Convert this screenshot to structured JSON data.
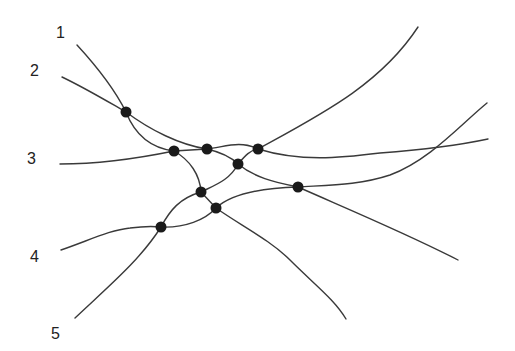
{
  "diagram": {
    "type": "network",
    "colors": {
      "line": "#3a3a3a",
      "node": "#1a1a1a",
      "label": "#222222",
      "background": "#ffffff"
    },
    "labels": [
      {
        "id": "1",
        "text": "1",
        "x": 56,
        "y": 38
      },
      {
        "id": "2",
        "text": "2",
        "x": 30,
        "y": 76
      },
      {
        "id": "3",
        "text": "3",
        "x": 27,
        "y": 164
      },
      {
        "id": "4",
        "text": "4",
        "x": 30,
        "y": 262
      },
      {
        "id": "5",
        "text": "5",
        "x": 51,
        "y": 339
      }
    ],
    "nodes": [
      {
        "id": "n1",
        "x": 126,
        "y": 112
      },
      {
        "id": "n2",
        "x": 174,
        "y": 151
      },
      {
        "id": "n3",
        "x": 207,
        "y": 149
      },
      {
        "id": "n4",
        "x": 258,
        "y": 149
      },
      {
        "id": "n5",
        "x": 238,
        "y": 164
      },
      {
        "id": "n6",
        "x": 298,
        "y": 187
      },
      {
        "id": "n7",
        "x": 201,
        "y": 192
      },
      {
        "id": "n8",
        "x": 216,
        "y": 208
      },
      {
        "id": "n9",
        "x": 161,
        "y": 227
      }
    ],
    "edges": [
      "M77,45 C100,70 115,90 126,112",
      "M62,77 C85,88 105,100 126,112",
      "M126,112 C150,130 180,145 207,149",
      "M126,112 C135,135 150,148 174,151",
      "M60,164 C100,164 140,158 174,151",
      "M174,151 L207,149",
      "M207,149 C225,147 240,140 258,149",
      "M207,149 C220,152 230,156 238,164",
      "M258,149 C320,115 380,85 418,27",
      "M258,149 C300,162 340,158 380,153 C420,150 460,145 488,139",
      "M238,164 C245,156 250,150 258,149",
      "M238,164 C255,178 275,182 298,187",
      "M298,187 C330,185 360,185 390,175 C430,160 460,125 487,103",
      "M298,187 C350,210 410,235 458,260",
      "M174,151 C190,160 200,175 201,192",
      "M238,164 C230,180 215,185 201,192",
      "M201,192 L216,208",
      "M201,192 C180,198 170,210 161,227",
      "M216,208 C230,195 260,188 298,187",
      "M216,208 C205,220 185,228 161,227",
      "M216,208 C240,225 270,240 290,260 C315,285 335,300 346,319",
      "M61,250 C90,240 110,230 130,228 C145,226 152,226 161,227",
      "M161,227 C140,260 110,285 75,318"
    ]
  }
}
